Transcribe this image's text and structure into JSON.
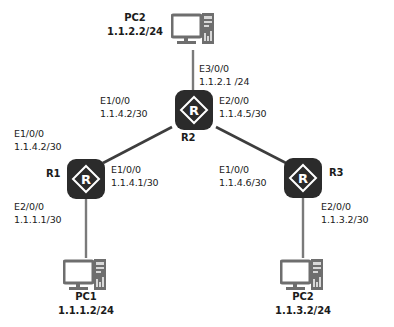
{
  "diagram": {
    "background_color": "#ffffff",
    "router_color": "#2b2b2b",
    "pc_color": "#6e6e6e",
    "link_color": "#3d3d3d"
  },
  "devices": {
    "pc_top": {
      "name": "PC2",
      "ip": "1.1.2.2/24",
      "icon": "pc-icon"
    },
    "pc_bottom_left": {
      "name": "PC1",
      "ip": "1.1.1.2/24",
      "icon": "pc-icon"
    },
    "pc_bottom_right": {
      "name": "PC2",
      "ip": "1.1.3.2/24",
      "icon": "pc-icon"
    },
    "r1": {
      "name": "R1",
      "icon": "router-icon",
      "glyph": "R"
    },
    "r2": {
      "name": "R2",
      "icon": "router-icon",
      "glyph": "R"
    },
    "r3": {
      "name": "R3",
      "icon": "router-icon",
      "glyph": "R"
    }
  },
  "interfaces": {
    "r2_e3": {
      "port": "E3/0/0",
      "address": "1.1.2.1 /24"
    },
    "r2_e1": {
      "port": "E1/0/0",
      "address": "1.1.4.2/30"
    },
    "r2_e2": {
      "port": "E2/0/0",
      "address": "1.1.4.5/30"
    },
    "r1_upper": {
      "port": "E1/0/0",
      "address": "1.1.4.2/30"
    },
    "r1_e1": {
      "port": "E1/0/0",
      "address": "1.1.4.1/30"
    },
    "r1_e2": {
      "port": "E2/0/0",
      "address": "1.1.1.1/30"
    },
    "r3_e1": {
      "port": "E1/0/0",
      "address": "1.1.4.6/30"
    },
    "r3_e2": {
      "port": "E2/0/0",
      "address": "1.1.3.2/30"
    }
  }
}
